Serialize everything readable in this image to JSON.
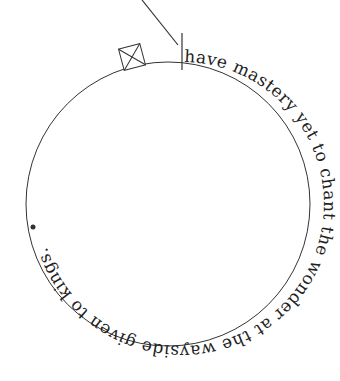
{
  "figure": {
    "text_on_circle": "have mastery yet to chant the wonder at the wayside given to kings.",
    "stroke_color": "#333333",
    "text_color": "#222222",
    "background": "#ffffff",
    "circle": {
      "cx": 168,
      "cy": 204,
      "r": 142
    },
    "marker": {
      "shape": "square-with-x",
      "x": 132,
      "y": 55
    },
    "pointer_line": {
      "x1": 142,
      "y1": 0,
      "x2": 178,
      "y2": 45
    },
    "start_tick": {
      "x": 182,
      "y1": 33,
      "y2": 68
    }
  }
}
